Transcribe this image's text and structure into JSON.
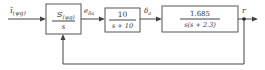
{
  "diagram": {
    "type": "block-diagram",
    "input_signal": {
      "symbol": "ī",
      "subscript": "(ψg)"
    },
    "blocks": [
      {
        "id": "block-1",
        "numerator": "S",
        "numerator_subscript": "(ψg)",
        "denominator": "s"
      },
      {
        "id": "block-2",
        "numerator": "10",
        "denominator": "s + 10"
      },
      {
        "id": "block-3",
        "numerator": "1.685",
        "denominator": "s(s + 2.3)"
      }
    ],
    "signals": [
      {
        "id": "sig-1",
        "symbol": "e",
        "subscript": "δa",
        "between": [
          "block-1",
          "block-2"
        ]
      },
      {
        "id": "sig-2",
        "symbol": "δ",
        "subscript": "a",
        "between": [
          "block-2",
          "block-3"
        ]
      },
      {
        "id": "output",
        "symbol": "r"
      }
    ],
    "feedback": {
      "from": "output",
      "to": "block-1",
      "enters": "bottom"
    },
    "colors": {
      "line": "#444444",
      "box_border": "#555555",
      "text": "#333333",
      "background": "#ffffff"
    }
  }
}
